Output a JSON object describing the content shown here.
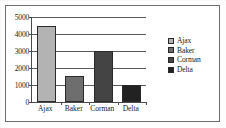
{
  "chart_data": {
    "type": "bar",
    "title": "",
    "subtitle": "",
    "xlabel": "",
    "ylabel": "",
    "categories": [
      "Ajax",
      "Baker",
      "Corman",
      "Delta"
    ],
    "values": [
      4500,
      1550,
      3000,
      1000
    ],
    "series": [
      {
        "name": "Series 1",
        "values": [
          4500,
          1550,
          3000,
          1000
        ]
      }
    ],
    "ylim": [
      0,
      5000
    ],
    "yticks": [
      0,
      1000,
      2000,
      3000,
      4000,
      5000
    ],
    "ytick_labels": [
      "0",
      "1000",
      "2000",
      "3000",
      "4000",
      "5000"
    ],
    "grid": true,
    "legend_position": "right",
    "legend": [
      {
        "label": "Ajax",
        "color": "#b3b3b3"
      },
      {
        "label": "Baker",
        "color": "#6e6e6e"
      },
      {
        "label": "Corman",
        "color": "#444444"
      },
      {
        "label": "Delta",
        "color": "#222222"
      }
    ],
    "bar_colors": [
      "#b3b3b3",
      "#6e6e6e",
      "#444444",
      "#222222"
    ],
    "bar_edge_color": "#2a2a2a",
    "axis_color": "#4a4a4a",
    "grid_color": "#5a5a5a",
    "text_color": "#1a1a1a",
    "background": "#ffffff",
    "frame_border_color": "#6e6e6e"
  }
}
